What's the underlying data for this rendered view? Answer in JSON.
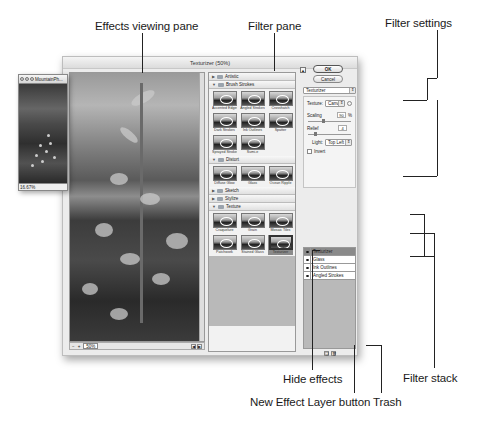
{
  "callouts": {
    "effects_viewing_pane": "Effects viewing pane",
    "filter_pane": "Filter pane",
    "filter_settings": "Filter settings",
    "hide_effects": "Hide effects",
    "new_effect_layer_button": "New Effect Layer button",
    "trash": "Trash",
    "filter_stack": "Filter stack"
  },
  "dialog": {
    "title": "Texturizer (50%)",
    "preview": {
      "zoom_value": "50%",
      "zoom_minus": "−",
      "zoom_plus": "+"
    },
    "filter_pane": {
      "categories": [
        {
          "name": "Artistic",
          "expanded": false,
          "filters": []
        },
        {
          "name": "Brush Strokes",
          "expanded": true,
          "filters": [
            "Accented Edges",
            "Angled Strokes",
            "Crosshatch",
            "Dark Strokes",
            "Ink Outlines",
            "Spatter",
            "Sprayed Strokes",
            "Sumi-e"
          ]
        },
        {
          "name": "Distort",
          "expanded": true,
          "filters": [
            "Diffuse Glow",
            "Glass",
            "Ocean Ripple"
          ]
        },
        {
          "name": "Sketch",
          "expanded": false,
          "filters": []
        },
        {
          "name": "Stylize",
          "expanded": false,
          "filters": []
        },
        {
          "name": "Texture",
          "expanded": true,
          "filters": [
            "Craquelure",
            "Grain",
            "Mosaic Tiles",
            "Patchwork",
            "Stained Glass",
            "Texturizer"
          ]
        }
      ],
      "selected_filter": "Texturizer"
    },
    "settings": {
      "ok_label": "OK",
      "cancel_label": "Cancel",
      "filter_select": "Texturizer",
      "texture_label": "Texture:",
      "texture_value": "Canvas",
      "scaling_label": "Scaling",
      "scaling_value": "90",
      "scaling_unit": "%",
      "relief_label": "Relief",
      "relief_value": "4",
      "light_label": "Light:",
      "light_value": "Top Left",
      "invert_label": "Invert",
      "invert_checked": false
    },
    "filter_stack": {
      "layers": [
        {
          "name": "Texturizer",
          "active": true
        },
        {
          "name": "Glass",
          "active": false
        },
        {
          "name": "Ink Outlines",
          "active": false
        },
        {
          "name": "Angled Strokes",
          "active": false
        }
      ]
    }
  },
  "document_window": {
    "title": "MountainPh...",
    "zoom": "16.67%"
  }
}
